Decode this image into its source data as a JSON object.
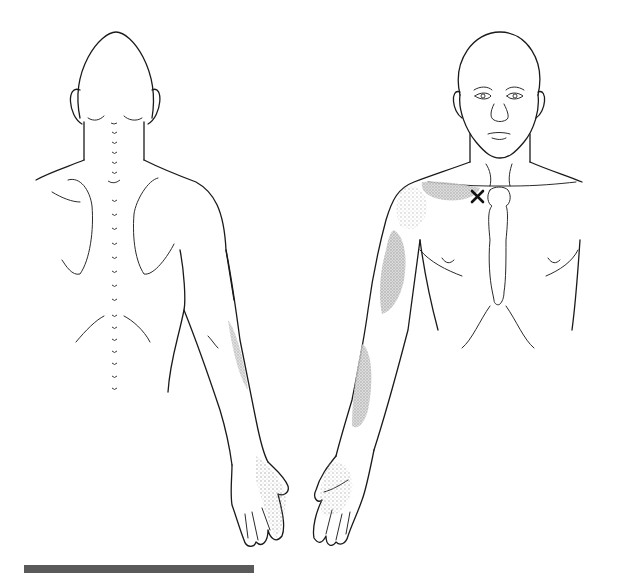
{
  "figure": {
    "type": "anatomical referred-pain diagram",
    "views": [
      {
        "id": "posterior",
        "label": "Back view (posterior)"
      },
      {
        "id": "anterior",
        "label": "Front view (anterior)"
      }
    ],
    "trigger_point": {
      "symbol": "X",
      "location": "below right clavicle, near sternum"
    },
    "referral_shading": {
      "color": "#b8b8b8",
      "regions": [
        "anterior shoulder / clavicular area",
        "anterior upper arm (biceps region)",
        "anterior forearm",
        "palm / radial hand",
        "posterior forearm (ulnar side)",
        "dorsum of hand"
      ]
    },
    "scale_bar": {
      "color": "#5a5a5a"
    }
  },
  "colors": {
    "background": "#ffffff",
    "outline": "#1a1a1a",
    "shading": "#b8b8b8",
    "marker": "#111111"
  }
}
